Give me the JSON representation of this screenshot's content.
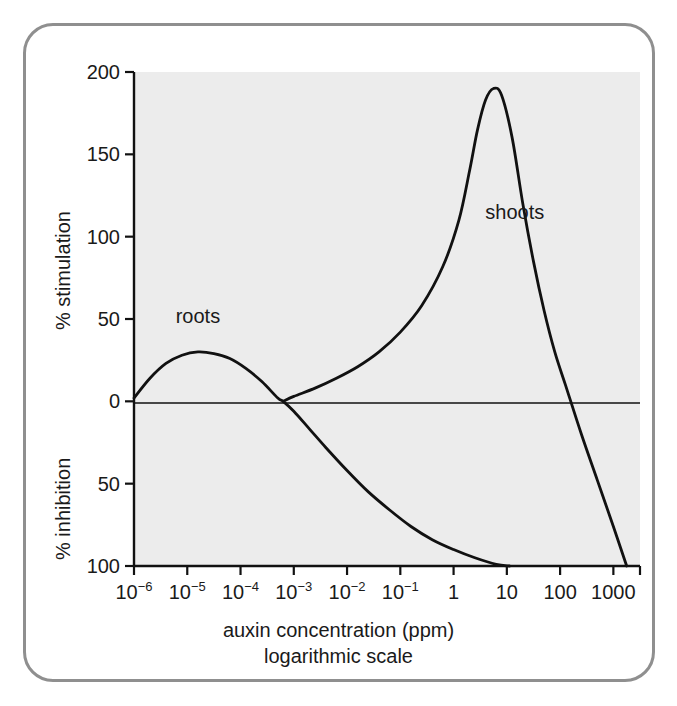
{
  "chart_data": {
    "type": "line",
    "title": "",
    "subtitle": "",
    "xlabel": "auxin concentration (ppm)",
    "xlabel_note": "logarithmic scale",
    "ylabel_upper": "% stimulation",
    "ylabel_lower": "% inhibition",
    "x_scale": "log10",
    "xlim_log10": [
      -6,
      3.5
    ],
    "ylim": [
      -100,
      200
    ],
    "grid": false,
    "legend": "inline-labels",
    "x_tick_labels": [
      "10−6",
      "10−5",
      "10−4",
      "10−3",
      "10−2",
      "10−1",
      "1",
      "10",
      "100",
      "1000"
    ],
    "x_tick_mantissas": [
      "10",
      "10",
      "10",
      "10",
      "10",
      "10",
      "1",
      "10",
      "100",
      "1000"
    ],
    "x_tick_exponents": [
      "−6",
      "−5",
      "−4",
      "−3",
      "−2",
      "−1",
      "",
      "",
      "",
      ""
    ],
    "x_tick_log10": [
      -6,
      -5,
      -4,
      -3,
      -2,
      -1,
      0,
      1,
      2,
      3
    ],
    "y_tick_labels": [
      "200",
      "150",
      "100",
      "50",
      "0",
      "50",
      "100"
    ],
    "y_tick_values": [
      200,
      150,
      100,
      50,
      0,
      -50,
      -100
    ],
    "zero_line": 0,
    "series": [
      {
        "name": "roots",
        "label": "roots",
        "label_log10_x": -4.8,
        "label_y": 52,
        "color": "#111111",
        "points_log10_x": [
          -6.0,
          -5.7,
          -5.4,
          -5.1,
          -4.8,
          -4.5,
          -4.2,
          -3.9,
          -3.6,
          -3.3,
          -3.2,
          -3.0,
          -2.7,
          -2.4,
          -2.0,
          -1.6,
          -1.2,
          -0.8,
          -0.4,
          0.0,
          0.4,
          0.8,
          1.05
        ],
        "values": [
          2,
          14,
          23,
          28,
          30,
          29,
          26,
          20,
          12,
          2,
          0,
          -6,
          -17,
          -28,
          -42,
          -55,
          -66,
          -76,
          -84,
          -90,
          -95,
          -99,
          -100
        ]
      },
      {
        "name": "shoots",
        "label": "shoots",
        "label_log10_x": 1.15,
        "label_y": 115,
        "color": "#111111",
        "points_log10_x": [
          -3.2,
          -3.0,
          -2.6,
          -2.2,
          -1.8,
          -1.4,
          -1.0,
          -0.6,
          -0.2,
          0.1,
          0.3,
          0.45,
          0.6,
          0.75,
          0.9,
          1.1,
          1.3,
          1.5,
          1.7,
          1.9,
          2.1,
          2.4,
          2.7,
          3.0,
          3.25
        ],
        "values": [
          0,
          3,
          8,
          14,
          21,
          30,
          42,
          58,
          82,
          110,
          140,
          165,
          183,
          190,
          186,
          160,
          120,
          85,
          55,
          30,
          10,
          -20,
          -48,
          -76,
          -100
        ]
      }
    ]
  },
  "axes": {
    "y_upper_title": "% stimulation",
    "y_lower_title": "% inhibition",
    "x_title_line1": "auxin concentration (ppm)",
    "x_title_line2": "logarithmic scale"
  },
  "colors": {
    "plot_background": "#ececec",
    "frame_border": "#8f8f8f",
    "axis": "#111111",
    "curve": "#111111",
    "text": "#1a1a1a",
    "page_background": "#ffffff"
  }
}
